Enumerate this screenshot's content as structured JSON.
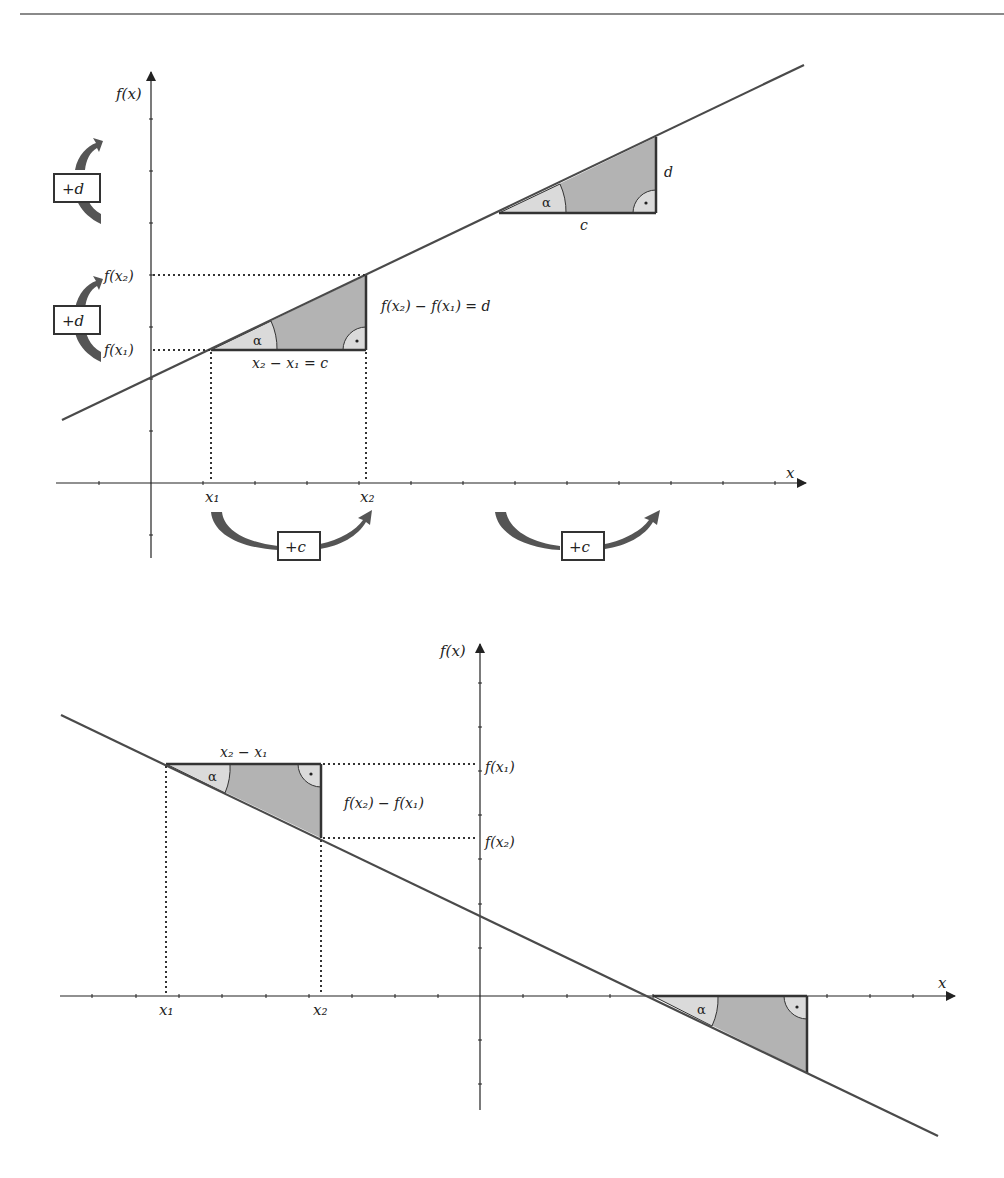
{
  "page": {
    "header_left": "3.3 Lineare Funktionen",
    "header_right": "105"
  },
  "colors": {
    "line": "#4a4a4a",
    "axis": "#222222",
    "triangle_dark": "#b3b3b3",
    "triangle_light": "#dadada",
    "arrow": "#555555",
    "text": "#222222"
  },
  "top_diagram": {
    "y_axis_label": "f(x)",
    "x_axis_label": "x",
    "x1_label": "x₁",
    "x2_label": "x₂",
    "fx1_label": "f(x₁)",
    "fx2_label": "f(x₂)",
    "triangle1": {
      "angle_label": "α",
      "base_label": "x₂ − x₁ = c",
      "height_label": "f(x₂) − f(x₁) = d"
    },
    "triangle2": {
      "angle_label": "α",
      "base_label": "c",
      "height_label": "d"
    },
    "boxes": {
      "plus_d_upper": "+d",
      "plus_d_lower": "+d",
      "plus_c_left": "+c",
      "plus_c_right": "+c"
    }
  },
  "bottom_diagram": {
    "y_axis_label": "f(x)",
    "x_axis_label": "x",
    "x1_label": "x₁",
    "x2_label": "x₂",
    "fx1_label": "f(x₁)",
    "fx2_label": "f(x₂)",
    "triangle1": {
      "angle_label": "α",
      "base_label": "x₂ − x₁",
      "height_label": "f(x₂) − f(x₁)"
    },
    "triangle2": {
      "angle_label": "α"
    }
  }
}
